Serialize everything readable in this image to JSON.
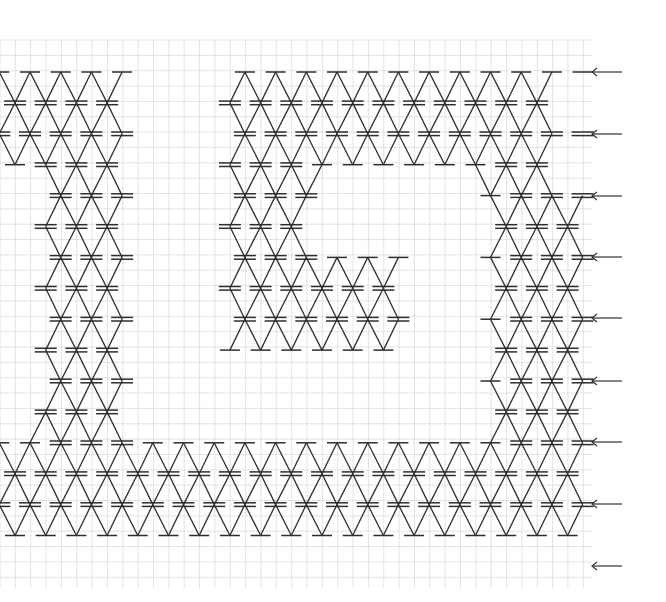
{
  "diagram": {
    "type": "crochet-lace-chart",
    "background": "#ffffff",
    "grid": {
      "color": "#dcdcdc",
      "x_start": 0,
      "x_end": 592,
      "y_start": 40,
      "y_end": 588,
      "cell": 15.35
    },
    "stitch_color": "#2e2e2e",
    "lattice": {
      "even_row_x0": 30,
      "odd_row_x0": 15,
      "pitch": 30.7,
      "row_y0": 72,
      "row_pitch": 30.9
    },
    "legend_note": "S = single bar node, D = double bar node",
    "rows": [
      {
        "r": 0,
        "nodes": [
          [
            -1,
            "S"
          ],
          [
            0,
            "S"
          ],
          [
            1,
            "S"
          ],
          [
            2,
            "S"
          ],
          [
            3,
            "S"
          ],
          [
            7,
            "S"
          ],
          [
            8,
            "S"
          ],
          [
            9,
            "S"
          ],
          [
            10,
            "S"
          ],
          [
            11,
            "S"
          ],
          [
            12,
            "S"
          ],
          [
            13,
            "S"
          ],
          [
            14,
            "S"
          ],
          [
            15,
            "S"
          ],
          [
            16,
            "S"
          ],
          [
            17,
            "S"
          ],
          [
            18,
            "S"
          ]
        ]
      },
      {
        "r": 1,
        "nodes": [
          [
            0,
            "D"
          ],
          [
            1,
            "D"
          ],
          [
            2,
            "D"
          ],
          [
            3,
            "D"
          ],
          [
            7,
            "D"
          ],
          [
            8,
            "D"
          ],
          [
            9,
            "D"
          ],
          [
            10,
            "D"
          ],
          [
            11,
            "D"
          ],
          [
            12,
            "D"
          ],
          [
            13,
            "D"
          ],
          [
            14,
            "D"
          ],
          [
            15,
            "D"
          ],
          [
            16,
            "D"
          ],
          [
            17,
            "D"
          ]
        ]
      },
      {
        "r": 2,
        "nodes": [
          [
            -1,
            "D"
          ],
          [
            0,
            "D"
          ],
          [
            1,
            "D"
          ],
          [
            2,
            "D"
          ],
          [
            3,
            "D"
          ],
          [
            7,
            "D"
          ],
          [
            8,
            "D"
          ],
          [
            9,
            "D"
          ],
          [
            10,
            "D"
          ],
          [
            11,
            "D"
          ],
          [
            12,
            "D"
          ],
          [
            13,
            "D"
          ],
          [
            14,
            "D"
          ],
          [
            15,
            "D"
          ],
          [
            16,
            "D"
          ],
          [
            17,
            "D"
          ],
          [
            18,
            "D"
          ]
        ]
      },
      {
        "r": 3,
        "nodes": [
          [
            0,
            "S"
          ],
          [
            1,
            "D"
          ],
          [
            2,
            "D"
          ],
          [
            3,
            "D"
          ],
          [
            7,
            "D"
          ],
          [
            8,
            "D"
          ],
          [
            9,
            "D"
          ],
          [
            10,
            "S"
          ],
          [
            11,
            "S"
          ],
          [
            12,
            "S"
          ],
          [
            13,
            "S"
          ],
          [
            14,
            "S"
          ],
          [
            15,
            "S"
          ],
          [
            16,
            "D"
          ],
          [
            17,
            "D"
          ]
        ]
      },
      {
        "r": 4,
        "nodes": [
          [
            1,
            "D"
          ],
          [
            2,
            "D"
          ],
          [
            3,
            "D"
          ],
          [
            7,
            "D"
          ],
          [
            8,
            "D"
          ],
          [
            9,
            "D"
          ],
          [
            15,
            "S"
          ],
          [
            16,
            "D"
          ],
          [
            17,
            "D"
          ],
          [
            18,
            "D"
          ]
        ]
      },
      {
        "r": 5,
        "nodes": [
          [
            1,
            "D"
          ],
          [
            2,
            "D"
          ],
          [
            3,
            "D"
          ],
          [
            7,
            "D"
          ],
          [
            8,
            "D"
          ],
          [
            9,
            "D"
          ],
          [
            16,
            "D"
          ],
          [
            17,
            "D"
          ],
          [
            18,
            "D"
          ]
        ]
      },
      {
        "r": 6,
        "nodes": [
          [
            1,
            "D"
          ],
          [
            2,
            "D"
          ],
          [
            3,
            "D"
          ],
          [
            7,
            "D"
          ],
          [
            8,
            "D"
          ],
          [
            9,
            "D"
          ],
          [
            10,
            "S"
          ],
          [
            11,
            "S"
          ],
          [
            12,
            "S"
          ],
          [
            15,
            "S"
          ],
          [
            16,
            "D"
          ],
          [
            17,
            "D"
          ],
          [
            18,
            "D"
          ]
        ]
      },
      {
        "r": 7,
        "nodes": [
          [
            1,
            "D"
          ],
          [
            2,
            "D"
          ],
          [
            3,
            "D"
          ],
          [
            7,
            "D"
          ],
          [
            8,
            "D"
          ],
          [
            9,
            "D"
          ],
          [
            10,
            "D"
          ],
          [
            11,
            "D"
          ],
          [
            12,
            "D"
          ],
          [
            16,
            "D"
          ],
          [
            17,
            "D"
          ],
          [
            18,
            "D"
          ]
        ]
      },
      {
        "r": 8,
        "nodes": [
          [
            1,
            "D"
          ],
          [
            2,
            "D"
          ],
          [
            3,
            "D"
          ],
          [
            7,
            "D"
          ],
          [
            8,
            "D"
          ],
          [
            9,
            "D"
          ],
          [
            10,
            "D"
          ],
          [
            11,
            "D"
          ],
          [
            12,
            "D"
          ],
          [
            15,
            "S"
          ],
          [
            16,
            "D"
          ],
          [
            17,
            "D"
          ],
          [
            18,
            "D"
          ]
        ]
      },
      {
        "r": 9,
        "nodes": [
          [
            1,
            "D"
          ],
          [
            2,
            "D"
          ],
          [
            3,
            "D"
          ],
          [
            7,
            "S"
          ],
          [
            8,
            "S"
          ],
          [
            9,
            "S"
          ],
          [
            10,
            "S"
          ],
          [
            11,
            "S"
          ],
          [
            12,
            "S"
          ],
          [
            16,
            "D"
          ],
          [
            17,
            "D"
          ],
          [
            18,
            "D"
          ]
        ]
      },
      {
        "r": 10,
        "nodes": [
          [
            1,
            "D"
          ],
          [
            2,
            "D"
          ],
          [
            3,
            "D"
          ],
          [
            15,
            "S"
          ],
          [
            16,
            "D"
          ],
          [
            17,
            "D"
          ],
          [
            18,
            "D"
          ]
        ]
      },
      {
        "r": 11,
        "nodes": [
          [
            1,
            "D"
          ],
          [
            2,
            "D"
          ],
          [
            3,
            "D"
          ],
          [
            16,
            "D"
          ],
          [
            17,
            "D"
          ],
          [
            18,
            "D"
          ]
        ]
      },
      {
        "r": 12,
        "nodes": [
          [
            -1,
            "S"
          ],
          [
            0,
            "S"
          ],
          [
            1,
            "D"
          ],
          [
            2,
            "D"
          ],
          [
            3,
            "D"
          ],
          [
            4,
            "S"
          ],
          [
            5,
            "S"
          ],
          [
            6,
            "S"
          ],
          [
            7,
            "S"
          ],
          [
            8,
            "S"
          ],
          [
            9,
            "S"
          ],
          [
            10,
            "S"
          ],
          [
            11,
            "S"
          ],
          [
            12,
            "S"
          ],
          [
            13,
            "S"
          ],
          [
            14,
            "S"
          ],
          [
            15,
            "S"
          ],
          [
            16,
            "D"
          ],
          [
            17,
            "D"
          ],
          [
            18,
            "D"
          ]
        ]
      },
      {
        "r": 13,
        "nodes": [
          [
            0,
            "D"
          ],
          [
            1,
            "D"
          ],
          [
            2,
            "D"
          ],
          [
            3,
            "D"
          ],
          [
            4,
            "D"
          ],
          [
            5,
            "D"
          ],
          [
            6,
            "D"
          ],
          [
            7,
            "D"
          ],
          [
            8,
            "D"
          ],
          [
            9,
            "D"
          ],
          [
            10,
            "D"
          ],
          [
            11,
            "D"
          ],
          [
            12,
            "D"
          ],
          [
            13,
            "D"
          ],
          [
            14,
            "D"
          ],
          [
            15,
            "D"
          ],
          [
            16,
            "D"
          ],
          [
            17,
            "D"
          ],
          [
            18,
            "D"
          ]
        ]
      },
      {
        "r": 14,
        "nodes": [
          [
            -1,
            "D"
          ],
          [
            0,
            "D"
          ],
          [
            1,
            "D"
          ],
          [
            2,
            "D"
          ],
          [
            3,
            "D"
          ],
          [
            4,
            "D"
          ],
          [
            5,
            "D"
          ],
          [
            6,
            "D"
          ],
          [
            7,
            "D"
          ],
          [
            8,
            "D"
          ],
          [
            9,
            "D"
          ],
          [
            10,
            "D"
          ],
          [
            11,
            "D"
          ],
          [
            12,
            "D"
          ],
          [
            13,
            "D"
          ],
          [
            14,
            "D"
          ],
          [
            15,
            "D"
          ],
          [
            16,
            "D"
          ],
          [
            17,
            "D"
          ],
          [
            18,
            "D"
          ]
        ]
      },
      {
        "r": 15,
        "nodes": [
          [
            0,
            "S"
          ],
          [
            1,
            "S"
          ],
          [
            2,
            "S"
          ],
          [
            3,
            "S"
          ],
          [
            4,
            "S"
          ],
          [
            5,
            "S"
          ],
          [
            6,
            "S"
          ],
          [
            7,
            "S"
          ],
          [
            8,
            "S"
          ],
          [
            9,
            "S"
          ],
          [
            10,
            "S"
          ],
          [
            11,
            "S"
          ],
          [
            12,
            "S"
          ],
          [
            13,
            "S"
          ],
          [
            14,
            "S"
          ],
          [
            15,
            "S"
          ],
          [
            16,
            "S"
          ],
          [
            17,
            "S"
          ],
          [
            18,
            "S"
          ]
        ]
      }
    ],
    "row_arrows": {
      "direction": "left",
      "x_tip": 592,
      "x_tail": 622,
      "y": [
        72,
        134,
        196,
        257,
        318,
        381,
        442,
        504,
        566
      ]
    }
  }
}
